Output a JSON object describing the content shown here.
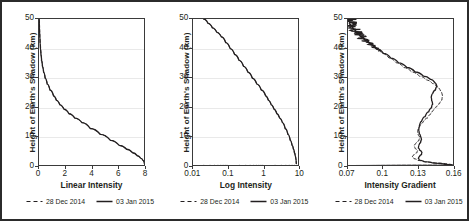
{
  "figure": {
    "panel_count": 3,
    "border_color": "#2b2b2b",
    "grid_color": "#e9e9e9",
    "axis_color": "#3a3a3a"
  },
  "legend": {
    "entries": [
      {
        "label": "28 Dec 2014",
        "style": "dashed",
        "color": "#231f20"
      },
      {
        "label": "03 Jan 2015",
        "style": "solid",
        "color": "#231f20"
      }
    ]
  },
  "shared": {
    "ylabel": "Height of Earth's Shadow (km)",
    "yticks": [
      "0",
      "10",
      "20",
      "30",
      "40",
      "50"
    ],
    "ylim": [
      0,
      50
    ]
  },
  "chart_data": [
    {
      "type": "line",
      "title": "",
      "xlabel": "Linear Intensity",
      "ylabel": "Height of Earth's Shadow (km)",
      "xscale": "linear",
      "yscale": "linear",
      "xlim": [
        0,
        8
      ],
      "ylim": [
        0,
        50
      ],
      "xticks": [
        0,
        2,
        4,
        6,
        8
      ],
      "yticks": [
        0,
        10,
        20,
        30,
        40,
        50
      ],
      "xtick_labels": [
        "0",
        "2",
        "4",
        "6",
        "8"
      ],
      "ytick_labels": [
        "0",
        "10",
        "20",
        "30",
        "40",
        "50"
      ],
      "grid": "horizontal",
      "legend_position": "below",
      "series": [
        {
          "name": "28 Dec 2014",
          "style": "dashed",
          "x": [
            0.02,
            0.026,
            0.035,
            0.047,
            0.062,
            0.083,
            0.11,
            0.147,
            0.196,
            0.261,
            0.347,
            0.462,
            0.616,
            0.82,
            1.092,
            1.3,
            1.56,
            1.87,
            2.24,
            2.68,
            3.21,
            3.84,
            4.59,
            5.34,
            6.0,
            6.55,
            7.0,
            7.35,
            7.6,
            7.78,
            7.88
          ],
          "y": [
            50.0,
            48.5,
            47.0,
            45.5,
            44.0,
            42.0,
            40.0,
            38.0,
            36.0,
            34.0,
            32.0,
            30.0,
            28.0,
            26.0,
            24.0,
            22.5,
            21.0,
            19.5,
            18.0,
            16.5,
            15.0,
            13.0,
            11.0,
            9.0,
            7.3,
            6.0,
            4.8,
            3.8,
            3.0,
            2.2,
            1.2
          ]
        },
        {
          "name": "03 Jan 2015",
          "style": "solid",
          "x": [
            0.02,
            0.026,
            0.035,
            0.047,
            0.062,
            0.083,
            0.11,
            0.147,
            0.196,
            0.261,
            0.347,
            0.462,
            0.616,
            0.82,
            1.092,
            1.3,
            1.56,
            1.87,
            2.24,
            2.68,
            3.21,
            3.84,
            4.59,
            5.34,
            6.0,
            6.55,
            7.0,
            7.35,
            7.6,
            7.78,
            7.88
          ],
          "y": [
            50.0,
            48.5,
            47.0,
            45.5,
            44.0,
            42.0,
            40.0,
            38.0,
            36.0,
            34.0,
            32.0,
            30.0,
            28.0,
            26.0,
            24.0,
            22.5,
            21.0,
            19.5,
            18.0,
            16.5,
            15.0,
            13.0,
            11.0,
            9.0,
            7.3,
            6.0,
            4.8,
            3.8,
            3.0,
            2.2,
            1.2
          ]
        }
      ]
    },
    {
      "type": "line",
      "title": "",
      "xlabel": "Log Intensity",
      "ylabel": "Height of Earth's Shadow (km)",
      "xscale": "log",
      "yscale": "linear",
      "xlim": [
        0.01,
        10
      ],
      "ylim": [
        0,
        50
      ],
      "xticks": [
        0.01,
        0.1,
        1,
        10
      ],
      "yticks": [
        0,
        10,
        20,
        30,
        40,
        50
      ],
      "xtick_labels": [
        "0.01",
        "0.1",
        "1",
        "10"
      ],
      "ytick_labels": [
        "0",
        "10",
        "20",
        "30",
        "40",
        "50"
      ],
      "grid": "horizontal",
      "legend_position": "below",
      "series": [
        {
          "name": "28 Dec 2014",
          "style": "dashed",
          "x": [
            0.02,
            0.0265,
            0.035,
            0.0465,
            0.062,
            0.083,
            0.11,
            0.147,
            0.196,
            0.261,
            0.347,
            0.462,
            0.616,
            0.82,
            1.092,
            1.3,
            1.56,
            1.87,
            2.24,
            2.68,
            3.21,
            3.84,
            4.59,
            5.34,
            6.0,
            6.55,
            7.0,
            7.35,
            7.6,
            7.78,
            7.88
          ],
          "y": [
            50.0,
            48.5,
            47.0,
            45.5,
            44.0,
            42.0,
            40.0,
            38.0,
            36.0,
            34.0,
            32.0,
            30.0,
            28.0,
            26.0,
            24.0,
            22.5,
            21.0,
            19.5,
            18.0,
            16.5,
            15.0,
            13.0,
            11.0,
            9.0,
            7.3,
            6.0,
            4.8,
            3.8,
            3.0,
            2.2,
            1.2
          ]
        },
        {
          "name": "03 Jan 2015",
          "style": "solid",
          "x": [
            0.02,
            0.0265,
            0.035,
            0.0465,
            0.062,
            0.083,
            0.11,
            0.147,
            0.196,
            0.261,
            0.347,
            0.462,
            0.616,
            0.82,
            1.092,
            1.3,
            1.56,
            1.87,
            2.24,
            2.68,
            3.21,
            3.84,
            4.59,
            5.34,
            6.0,
            6.55,
            7.0,
            7.35,
            7.6,
            7.78,
            7.88
          ],
          "y": [
            50.0,
            48.5,
            47.0,
            45.5,
            44.0,
            42.0,
            40.0,
            38.0,
            36.0,
            34.0,
            32.0,
            30.0,
            28.0,
            26.0,
            24.0,
            22.5,
            21.0,
            19.5,
            18.0,
            16.5,
            15.0,
            13.0,
            11.0,
            9.0,
            7.3,
            6.0,
            4.8,
            3.8,
            3.0,
            2.2,
            1.2
          ]
        }
      ]
    },
    {
      "type": "line",
      "title": "",
      "xlabel": "Intensity Gradient",
      "ylabel": "Height of Earth's Shadow (km)",
      "xscale": "linear",
      "yscale": "linear",
      "xlim": [
        0.07,
        0.16
      ],
      "ylim": [
        0,
        50
      ],
      "xticks": [
        0.07,
        0.1,
        0.13,
        0.16
      ],
      "yticks": [
        0,
        10,
        20,
        30,
        40,
        50
      ],
      "xtick_labels": [
        "0.07",
        "0.1",
        "0.13",
        "0.16"
      ],
      "ytick_labels": [
        "0",
        "10",
        "20",
        "30",
        "40",
        "50"
      ],
      "grid": "horizontal",
      "legend_position": "below",
      "noise_top": true,
      "series": [
        {
          "name": "28 Dec 2014",
          "style": "dashed",
          "x": [
            0.0695,
            0.07,
            0.071,
            0.0725,
            0.0745,
            0.077,
            0.08,
            0.084,
            0.0885,
            0.093,
            0.0985,
            0.1045,
            0.1105,
            0.117,
            0.1235,
            0.13,
            0.136,
            0.141,
            0.145,
            0.148,
            0.1495,
            0.149,
            0.147,
            0.1445,
            0.142,
            0.14,
            0.137,
            0.133,
            0.13,
            0.1285,
            0.129,
            0.1305,
            0.1295,
            0.127,
            0.1255,
            0.1265,
            0.1285,
            0.128,
            0.1255,
            0.124,
            0.1255,
            0.129,
            0.135,
            0.145,
            0.156,
            0.1585,
            0.072,
            0.07
          ],
          "y": [
            50.0,
            49.2,
            48.3,
            47.4,
            46.4,
            45.3,
            44.1,
            42.8,
            41.4,
            40.0,
            38.4,
            36.8,
            35.2,
            33.6,
            32.1,
            30.7,
            29.4,
            28.2,
            27.0,
            25.6,
            24.0,
            22.6,
            21.4,
            20.3,
            19.2,
            18.0,
            16.6,
            15.0,
            13.4,
            12.0,
            10.8,
            9.8,
            8.8,
            7.9,
            7.0,
            6.2,
            5.5,
            4.8,
            4.1,
            3.4,
            2.8,
            2.2,
            1.7,
            1.3,
            0.9,
            0.6,
            0.45,
            0.4
          ]
        },
        {
          "name": "03 Jan 2015",
          "style": "solid",
          "x": [
            0.07,
            0.0706,
            0.0716,
            0.073,
            0.075,
            0.0775,
            0.0806,
            0.0846,
            0.0892,
            0.094,
            0.0998,
            0.106,
            0.1125,
            0.1195,
            0.1265,
            0.1335,
            0.1395,
            0.1432,
            0.1448,
            0.1435,
            0.1412,
            0.14,
            0.1404,
            0.1412,
            0.1402,
            0.1378,
            0.1348,
            0.1318,
            0.13,
            0.1295,
            0.13,
            0.1312,
            0.1318,
            0.131,
            0.1296,
            0.1292,
            0.1305,
            0.1322,
            0.1318,
            0.13,
            0.1292,
            0.13,
            0.134,
            0.142,
            0.153,
            0.158,
            0.0725,
            0.0702
          ],
          "y": [
            50.0,
            49.2,
            48.3,
            47.4,
            46.4,
            45.3,
            44.1,
            42.8,
            41.4,
            40.0,
            38.4,
            36.8,
            35.2,
            33.6,
            32.1,
            30.7,
            29.6,
            28.4,
            27.2,
            26.0,
            24.8,
            23.6,
            22.4,
            21.2,
            20.0,
            18.6,
            17.0,
            15.4,
            13.8,
            12.4,
            11.2,
            10.2,
            9.2,
            8.2,
            7.3,
            6.4,
            5.6,
            4.9,
            4.2,
            3.5,
            2.9,
            2.3,
            1.8,
            1.3,
            0.9,
            0.6,
            0.45,
            0.4
          ]
        }
      ]
    }
  ]
}
